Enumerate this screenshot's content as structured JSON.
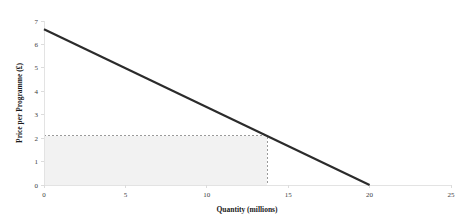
{
  "chart_data": {
    "type": "line",
    "title": "",
    "xlabel": "Quantity (millions)",
    "ylabel": "Price per Programme (£)",
    "xlim": [
      0,
      25
    ],
    "ylim": [
      0,
      7
    ],
    "xticks": [
      0,
      5,
      10,
      15,
      20,
      25
    ],
    "yticks": [
      0,
      1,
      2,
      3,
      4,
      5,
      6,
      7
    ],
    "xtick_labels": [
      "0",
      "5",
      "10",
      "15",
      "20",
      "25"
    ],
    "ytick_labels": [
      "0",
      "1",
      "2",
      "3",
      "4",
      "5",
      "6",
      "7"
    ],
    "grid": false,
    "legend": false,
    "series": [
      {
        "name": "Demand curve",
        "type": "line",
        "x": [
          0,
          20
        ],
        "values": [
          6.65,
          0
        ],
        "color": "#2b2b2b"
      }
    ],
    "annotations": [
      {
        "name": "revenue-rectangle",
        "shape": "rect",
        "x0": 0,
        "y0": 0,
        "x1": 13.7,
        "y1": 2.1,
        "fill": "#f2f2f2",
        "border": "#9a9a9a",
        "border_style": "dashed"
      }
    ]
  },
  "colors": {
    "line": "#2b2b2b",
    "axis": "#e3e3e3",
    "rect_fill": "#f2f2f2",
    "rect_border": "#9a9a9a",
    "text": "#1a1a1a",
    "tick_text": "#404040",
    "background": "#ffffff"
  }
}
